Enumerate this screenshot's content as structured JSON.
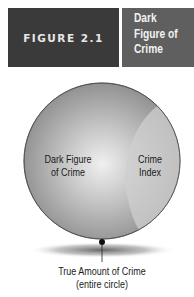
{
  "header": {
    "figure_label": "FIGURE 2.1",
    "title": "Dark Figure of Crime"
  },
  "diagram": {
    "regions": [
      {
        "id": "dark-figure",
        "label_line1": "Dark Figure",
        "label_line2": "of Crime"
      },
      {
        "id": "crime-index",
        "label_line1": "Crime",
        "label_line2": "Index"
      }
    ],
    "callout": {
      "line1": "True Amount of Crime",
      "line2": "(entire circle)"
    },
    "colors": {
      "header_dark": "#3a3a3a",
      "header_gray": "#5f5f5f",
      "circle_outer": "#8a8a8a",
      "circle_center": "#eeeeee",
      "crime_index_region": "#c9c9c9"
    }
  }
}
